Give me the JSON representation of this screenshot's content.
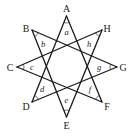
{
  "diagram": {
    "type": "eight-pointed star {8/3}",
    "vertices": [
      {
        "label": "A",
        "x": 66.5,
        "y": 16,
        "lx": 66.5,
        "ly": 12
      },
      {
        "label": "B",
        "x": 32,
        "y": 30,
        "lx": 26,
        "ly": 32
      },
      {
        "label": "C",
        "x": 17,
        "y": 67,
        "lx": 10,
        "ly": 70.5
      },
      {
        "label": "D",
        "x": 32,
        "y": 102,
        "lx": 26,
        "ly": 110
      },
      {
        "label": "E",
        "x": 66.5,
        "y": 117,
        "lx": 66.5,
        "ly": 129
      },
      {
        "label": "F",
        "x": 102,
        "y": 102,
        "lx": 107,
        "ly": 110
      },
      {
        "label": "G",
        "x": 117,
        "y": 67,
        "lx": 123,
        "ly": 70.5
      },
      {
        "label": "H",
        "x": 102,
        "y": 30,
        "lx": 107,
        "ly": 32
      }
    ],
    "edges": [
      [
        "A",
        "D"
      ],
      [
        "A",
        "F"
      ],
      [
        "B",
        "E"
      ],
      [
        "B",
        "G"
      ],
      [
        "C",
        "F"
      ],
      [
        "C",
        "H"
      ],
      [
        "D",
        "G"
      ],
      [
        "E",
        "H"
      ]
    ],
    "angles": [
      {
        "label": "a",
        "x": 66.5,
        "y": 35
      },
      {
        "label": "b",
        "x": 43,
        "y": 47
      },
      {
        "label": "c",
        "x": 32,
        "y": 69.5
      },
      {
        "label": "d",
        "x": 42,
        "y": 92
      },
      {
        "label": "e",
        "x": 66.5,
        "y": 103
      },
      {
        "label": "f",
        "x": 90,
        "y": 92
      },
      {
        "label": "g",
        "x": 99,
        "y": 69.5
      },
      {
        "label": "h",
        "x": 89,
        "y": 47
      }
    ]
  }
}
